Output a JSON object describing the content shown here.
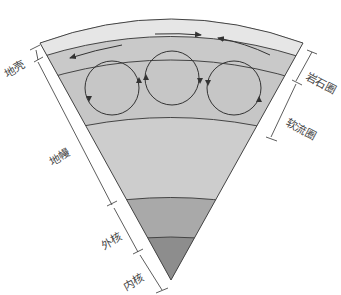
{
  "diagram": {
    "labels": {
      "crust": "地壳",
      "mantle": "地幔",
      "outer_core": "外核",
      "inner_core": "内核",
      "lithosphere": "岩石圈",
      "asthenosphere": "软流圈"
    },
    "colors": {
      "crust": "#e6e6e6",
      "lithosphere_lower": "#c9c9c9",
      "asthenosphere": "#c4c4c4",
      "mantle": "#cdcdcd",
      "outer_core": "#a8a8a8",
      "inner_core": "#8c8c8c",
      "line": "#444444"
    },
    "convection_cells": 3
  }
}
